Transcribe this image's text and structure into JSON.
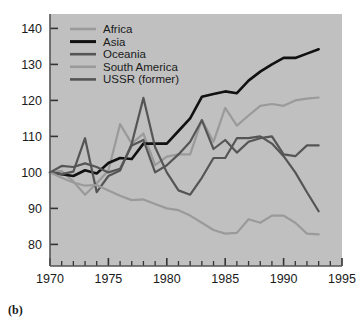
{
  "figure": {
    "caption": "(b)",
    "plot_background": "#c0c0c0",
    "page_background": "#ffffff",
    "frame_color": "#555555"
  },
  "chart_data": {
    "type": "line",
    "title": "",
    "subtitle": "",
    "xlabel": "",
    "ylabel": "",
    "xlim": [
      1970,
      1995
    ],
    "ylim": [
      74,
      144
    ],
    "yticks": [
      80,
      90,
      100,
      110,
      120,
      130,
      140
    ],
    "xticks": [
      1970,
      1975,
      1980,
      1985,
      1990,
      1995
    ],
    "xtick_labels": [
      "1970",
      "1975",
      "1980",
      "1985",
      "1990",
      "1995"
    ],
    "ytick_labels": [
      "80",
      "90",
      "100",
      "110",
      "120",
      "130",
      "140"
    ],
    "minor_xticks_every": 1,
    "grid": false,
    "legend_position": "top-left",
    "x": [
      1970,
      1971,
      1972,
      1973,
      1974,
      1975,
      1976,
      1977,
      1978,
      1979,
      1980,
      1981,
      1982,
      1983,
      1984,
      1985,
      1986,
      1987,
      1988,
      1989,
      1990,
      1991,
      1992,
      1993
    ],
    "series": [
      {
        "name": "Africa",
        "color": "#9a9a9a",
        "width": 2.2,
        "values": [
          100.0,
          100.4,
          97.5,
          93.8,
          97.0,
          100.5,
          113.4,
          108.0,
          110.8,
          102.0,
          104.4,
          105.0,
          105.0,
          114.6,
          108.5,
          117.9,
          113.0,
          115.8,
          118.5,
          119.0,
          118.5,
          120.0,
          120.5,
          120.8
        ]
      },
      {
        "name": "Asia",
        "color": "#111111",
        "width": 2.6,
        "values": [
          100.0,
          99.5,
          99.0,
          100.6,
          99.7,
          102.6,
          104.0,
          103.7,
          108.0,
          108.0,
          108.0,
          111.5,
          115.0,
          121.0,
          121.8,
          122.5,
          122.0,
          125.5,
          128.0,
          130.0,
          131.8,
          131.8,
          133.0,
          134.2
        ]
      },
      {
        "name": "Oceania",
        "color": "#555555",
        "width": 2.2,
        "values": [
          100.0,
          99.5,
          100.2,
          109.5,
          94.5,
          99.0,
          100.5,
          108.0,
          120.7,
          107.0,
          100.0,
          95.0,
          93.8,
          98.5,
          104.0,
          104.0,
          109.5,
          109.5,
          110.0,
          108.0,
          104.5,
          100.0,
          94.5,
          89.2
        ]
      },
      {
        "name": "South America",
        "color": "#9a9a9a",
        "width": 2.2,
        "values": [
          100.0,
          98.5,
          97.2,
          96.3,
          96.5,
          95.0,
          93.5,
          92.3,
          92.5,
          91.2,
          90.0,
          89.5,
          88.0,
          86.0,
          84.0,
          83.0,
          83.2,
          87.0,
          86.0,
          88.0,
          88.0,
          86.0,
          83.0,
          82.8
        ]
      },
      {
        "name": "USSR (former)",
        "color": "#555555",
        "width": 2.2,
        "values": [
          100.0,
          101.8,
          101.5,
          102.5,
          101.5,
          100.0,
          101.0,
          107.5,
          109.0,
          100.0,
          102.0,
          105.0,
          108.5,
          114.5,
          106.5,
          109.0,
          105.5,
          108.5,
          109.5,
          110.0,
          105.0,
          104.5,
          107.5,
          107.5
        ]
      }
    ],
    "legend_entries": [
      {
        "label": "Africa",
        "color": "#9a9a9a"
      },
      {
        "label": "Asia",
        "color": "#111111"
      },
      {
        "label": "Oceania",
        "color": "#555555"
      },
      {
        "label": "South America",
        "color": "#9a9a9a"
      },
      {
        "label": "USSR (former)",
        "color": "#555555"
      }
    ]
  }
}
